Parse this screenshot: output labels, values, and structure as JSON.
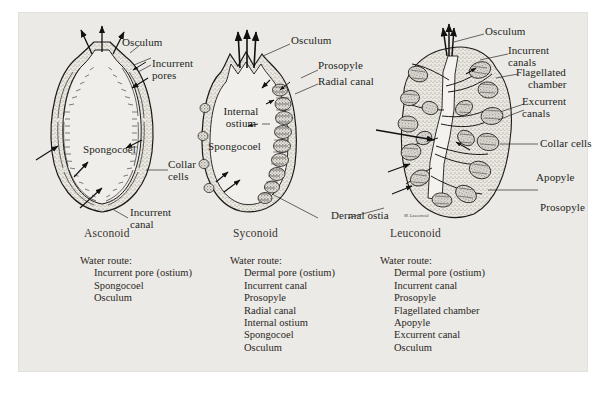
{
  "figure": {
    "caption_title": "Sponge body types",
    "types": [
      {
        "id": "asconoid",
        "name": "Asconoid"
      },
      {
        "id": "syconoid",
        "name": "Syconoid"
      },
      {
        "id": "leuconoid",
        "name": "Leuconoid"
      }
    ],
    "labels": {
      "asconoid": [
        {
          "name": "osculum",
          "text": "Osculum"
        },
        {
          "name": "incurrent-pores",
          "text": "Incurrent pores"
        },
        {
          "name": "spongocoel",
          "text": "Spongocoel"
        },
        {
          "name": "collar-cells",
          "text": "Collar cells"
        },
        {
          "name": "incurrent-canal",
          "text": "Incurrent canal"
        }
      ],
      "syconoid": [
        {
          "name": "osculum",
          "text": "Osculum"
        },
        {
          "name": "prosopyle",
          "text": "Prosopyle"
        },
        {
          "name": "radial-canal",
          "text": "Radial canal"
        },
        {
          "name": "internal-ostium",
          "text": "Internal ostium"
        },
        {
          "name": "spongocoel",
          "text": "Spongocoel"
        },
        {
          "name": "dermal-ostia",
          "text": "Dermal ostia"
        }
      ],
      "leuconoid": [
        {
          "name": "osculum",
          "text": "Osculum"
        },
        {
          "name": "incurrent-canals",
          "text": "Incurrent canals"
        },
        {
          "name": "flagellated-chamber",
          "text": "Flagellated chamber"
        },
        {
          "name": "excurrent-canals",
          "text": "Excurrent canals"
        },
        {
          "name": "collar-cells",
          "text": "Collar cells"
        },
        {
          "name": "apopyle",
          "text": "Apopyle"
        },
        {
          "name": "prosopyle",
          "text": "Prosopyle"
        }
      ]
    },
    "label_words": {
      "osculum": "Osculum",
      "incurrent": "Incurrent",
      "pores": "pores",
      "spongocoel": "Spongocoel",
      "collar": "Collar",
      "cells": "cells",
      "canal": "canal",
      "prosopyle": "Prosopyle",
      "radial_canal": "Radial canal",
      "internal": "Internal",
      "ostium": "ostium",
      "dermal_ostia": "Dermal ostia",
      "canals": "canals",
      "flagellated": "Flagellated",
      "chamber": "chamber",
      "excurrent": "Excurrent",
      "collar_cells": "Collar cells",
      "apopyle": "Apopyle",
      "incurrent_canal_l1": "Incurrent",
      "incurrent_canal_l2": "canal"
    },
    "signature": "M. Leuconoid",
    "routes": [
      {
        "id": "asconoid-route",
        "heading": "Water route:",
        "steps": [
          "Incurrent pore (ostium)",
          "Spongocoel",
          "Osculum"
        ]
      },
      {
        "id": "syconoid-route",
        "heading": "Water route:",
        "steps": [
          "Dermal pore (ostium)",
          "Incurrent canal",
          "Prosopyle",
          "Radial canal",
          "Internal ostium",
          "Spongocoel",
          "Osculum"
        ]
      },
      {
        "id": "leuconoid-route",
        "heading": "Water route:",
        "steps": [
          "Dermal pore (ostium)",
          "Incurrent canal",
          "Prosopyle",
          "Flagellated chamber",
          "Apopyle",
          "Excurrent canal",
          "Osculum"
        ]
      }
    ],
    "colors": {
      "page_background": "#ffffff",
      "panel_background": "#eceae6",
      "ink": "#1c1a18",
      "label_text": "#231f1c",
      "type_text": "#3a3532"
    }
  }
}
